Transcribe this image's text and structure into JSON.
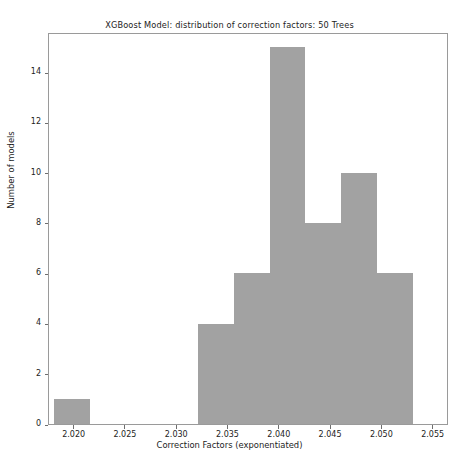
{
  "chart_data": {
    "type": "bar",
    "title": "XGBoost Model: distribution of correction factors: 50 Trees",
    "xlabel": "Correction Factors (exponentiated)",
    "ylabel": "Number of models",
    "xlim": [
      2.0175,
      2.0565
    ],
    "ylim": [
      0,
      15.6
    ],
    "xticks": [
      2.02,
      2.025,
      2.03,
      2.035,
      2.04,
      2.045,
      2.05,
      2.055
    ],
    "xtick_labels": [
      "2.020",
      "2.025",
      "2.030",
      "2.035",
      "2.040",
      "2.045",
      "2.050",
      "2.055"
    ],
    "yticks": [
      0,
      2,
      4,
      6,
      8,
      10,
      12,
      14
    ],
    "ytick_labels": [
      "0",
      "2",
      "4",
      "6",
      "8",
      "10",
      "12",
      "14"
    ],
    "grid": false,
    "legend": null,
    "bar_color": "#a2a2a2",
    "bin_width": 0.0035,
    "bins": [
      {
        "left": 2.018,
        "right": 2.0215,
        "count": 1
      },
      {
        "left": 2.032,
        "right": 2.0355,
        "count": 4
      },
      {
        "left": 2.0355,
        "right": 2.039,
        "count": 6
      },
      {
        "left": 2.039,
        "right": 2.0425,
        "count": 15
      },
      {
        "left": 2.0425,
        "right": 2.046,
        "count": 8
      },
      {
        "left": 2.046,
        "right": 2.0495,
        "count": 10
      },
      {
        "left": 2.0495,
        "right": 2.053,
        "count": 6
      }
    ],
    "categories": [
      "2.0180-2.0215",
      "2.0320-2.0355",
      "2.0355-2.0390",
      "2.0390-2.0425",
      "2.0425-2.0460",
      "2.0460-2.0495",
      "2.0495-2.0530"
    ],
    "values": [
      1,
      4,
      6,
      15,
      8,
      10,
      6
    ],
    "total_models": 50
  }
}
